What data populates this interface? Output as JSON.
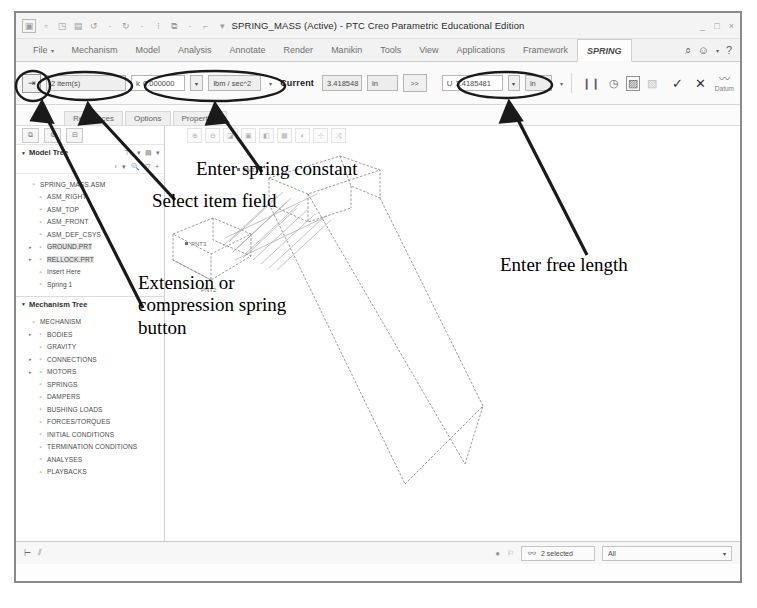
{
  "window": {
    "title": "SPRING_MASS (Active) - PTC Creo Parametric Educational Edition",
    "minimize": "_",
    "maximize": "□",
    "close": "×"
  },
  "quick_access": [
    "creo-logo-icon",
    "new-icon",
    "open-icon",
    "save-icon",
    "undo-icon",
    "redo-icon",
    "regenerate-icon",
    "window-icon",
    "close-window-icon",
    "customize-icon"
  ],
  "ribbon": {
    "tabs": [
      {
        "label": "File",
        "active": false
      },
      {
        "label": "Mechanism",
        "active": false
      },
      {
        "label": "Model",
        "active": false
      },
      {
        "label": "Analysis",
        "active": false
      },
      {
        "label": "Annotate",
        "active": false
      },
      {
        "label": "Render",
        "active": false
      },
      {
        "label": "Manikin",
        "active": false
      },
      {
        "label": "Tools",
        "active": false
      },
      {
        "label": "View",
        "active": false
      },
      {
        "label": "Applications",
        "active": false
      },
      {
        "label": "Framework",
        "active": false
      },
      {
        "label": "SPRING",
        "active": true
      }
    ],
    "right_icons": [
      "search-icon",
      "help-balloon-icon",
      "dropdown-caret-icon",
      "help-icon"
    ]
  },
  "dashboard": {
    "spring_type_button": "extension-compression-spring-icon",
    "select_item": {
      "value": "2 item(s)",
      "placeholder": "Select item"
    },
    "stiffness": {
      "symbol": "k",
      "value": "0.000000",
      "unit": "lbm / sec^2"
    },
    "current_label": "Current",
    "current": {
      "value": "3.418548",
      "unit": "in"
    },
    "expand_button": ">>",
    "free_length": {
      "symbol": "U",
      "value": "3.4185481",
      "unit": "in"
    },
    "icons": [
      "pause-icon",
      "refresh-icon",
      "preview-icon",
      "hide-preview-icon"
    ],
    "accept_label": "✓",
    "cancel_label": "✕",
    "datum_label": "Datum"
  },
  "subtabs": [
    {
      "label": "References"
    },
    {
      "label": "Options"
    },
    {
      "label": "Properties"
    }
  ],
  "nav": {
    "tools": [
      "show-icon",
      "settings-icon",
      "collapse-icon"
    ],
    "model_tree": {
      "title": "Model Tree",
      "header_icons": [
        "filter-icon",
        "caret-icon",
        "settings-icon",
        "caret2-icon"
      ],
      "filter_icons": [
        "back-icon",
        "caret-icon",
        "find-icon",
        "filter-icon",
        "plus-icon"
      ],
      "items": [
        {
          "label": "SPRING_MASS.ASM",
          "indent": 0,
          "expand": "",
          "icon": "assembly-icon",
          "selected": false
        },
        {
          "label": "ASM_RIGHT",
          "indent": 1,
          "expand": "",
          "icon": "datum-plane-icon",
          "selected": false
        },
        {
          "label": "ASM_TOP",
          "indent": 1,
          "expand": "",
          "icon": "datum-plane-icon",
          "selected": false
        },
        {
          "label": "ASM_FRONT",
          "indent": 1,
          "expand": "",
          "icon": "datum-plane-icon",
          "selected": false
        },
        {
          "label": "ASM_DEF_CSYS",
          "indent": 1,
          "expand": "",
          "icon": "csys-icon",
          "selected": false
        },
        {
          "label": "GROUND.PRT",
          "indent": 1,
          "expand": "▸",
          "icon": "part-icon",
          "selected": true
        },
        {
          "label": "RELLOCK.PRT",
          "indent": 1,
          "expand": "▸",
          "icon": "part-icon",
          "selected": true
        },
        {
          "label": "Insert Here",
          "indent": 1,
          "expand": "",
          "icon": "insert-icon",
          "selected": false
        },
        {
          "label": "Spring 1",
          "indent": 1,
          "expand": "",
          "icon": "spring-icon",
          "selected": false
        }
      ]
    },
    "mechanism_tree": {
      "title": "Mechanism Tree",
      "items": [
        {
          "label": "MECHANISM",
          "indent": 0,
          "expand": "",
          "icon": "mechanism-icon"
        },
        {
          "label": "BODIES",
          "indent": 1,
          "expand": "▸",
          "icon": "bodies-icon"
        },
        {
          "label": "GRAVITY",
          "indent": 1,
          "expand": "",
          "icon": "gravity-icon"
        },
        {
          "label": "CONNECTIONS",
          "indent": 1,
          "expand": "▸",
          "icon": "connections-icon"
        },
        {
          "label": "MOTORS",
          "indent": 1,
          "expand": "▸",
          "icon": "motors-icon"
        },
        {
          "label": "SPRINGS",
          "indent": 1,
          "expand": "",
          "icon": "springs-icon"
        },
        {
          "label": "DAMPERS",
          "indent": 1,
          "expand": "",
          "icon": "dampers-icon"
        },
        {
          "label": "BUSHING LOADS",
          "indent": 1,
          "expand": "",
          "icon": "bushing-loads-icon"
        },
        {
          "label": "FORCES/TORQUES",
          "indent": 1,
          "expand": "",
          "icon": "forces-torques-icon"
        },
        {
          "label": "INITIAL CONDITIONS",
          "indent": 1,
          "expand": "",
          "icon": "initial-conditions-icon"
        },
        {
          "label": "TERMINATION CONDITIONS",
          "indent": 1,
          "expand": "",
          "icon": "termination-conditions-icon"
        },
        {
          "label": "ANALYSES",
          "indent": 1,
          "expand": "",
          "icon": "analyses-icon"
        },
        {
          "label": "PLAYBACKS",
          "indent": 1,
          "expand": "",
          "icon": "playbacks-icon"
        }
      ]
    }
  },
  "viewport": {
    "graphics_icons": [
      "zoom-in-icon",
      "zoom-out-icon",
      "refit-icon",
      "repaint-icon",
      "display-style-icon",
      "saved-views-icon",
      "appearance-icon",
      "datum-display-icon",
      "annotation-display-icon"
    ],
    "point_labels": [
      "PNT1",
      "PNT2",
      "PNT3"
    ]
  },
  "annotations": [
    {
      "id": "enter-spring-constant",
      "text": "Enter spring constant",
      "italic": false
    },
    {
      "id": "select-item-field",
      "text_italic": "Select item",
      "text": " field"
    },
    {
      "id": "extension-compression",
      "line1_italic": "Extension or",
      "line2_italic": "compression spring",
      "line3": "button"
    },
    {
      "id": "enter-free-length",
      "text": "Enter free length",
      "italic": false
    }
  ],
  "statusbar": {
    "left_icons": [
      "snapshot-icon",
      "filter-icon"
    ],
    "right_icons": [
      "record-icon",
      "flag-icon"
    ],
    "search_icon": "binoculars-icon",
    "selected_text": "2 selected",
    "filter_value": "All",
    "filter_caret": "▾"
  }
}
